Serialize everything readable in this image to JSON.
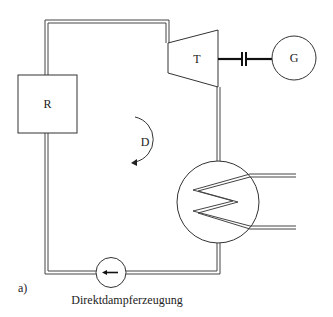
{
  "diagram": {
    "type": "process-flow",
    "caption": "Direktdampferzeugung",
    "panel_label": "a)",
    "components": {
      "receiver": {
        "label": "R",
        "name": "Receiver"
      },
      "turbine": {
        "label": "T",
        "name": "Turbine"
      },
      "generator": {
        "label": "G",
        "name": "Generator"
      },
      "flow_direction": {
        "label": "D"
      },
      "heat_exchanger": {
        "label": "",
        "name": "Condenser"
      },
      "pump": {
        "label": "",
        "name": "Pump"
      }
    },
    "colors": {
      "line": "#333333",
      "background": "#ffffff"
    }
  }
}
